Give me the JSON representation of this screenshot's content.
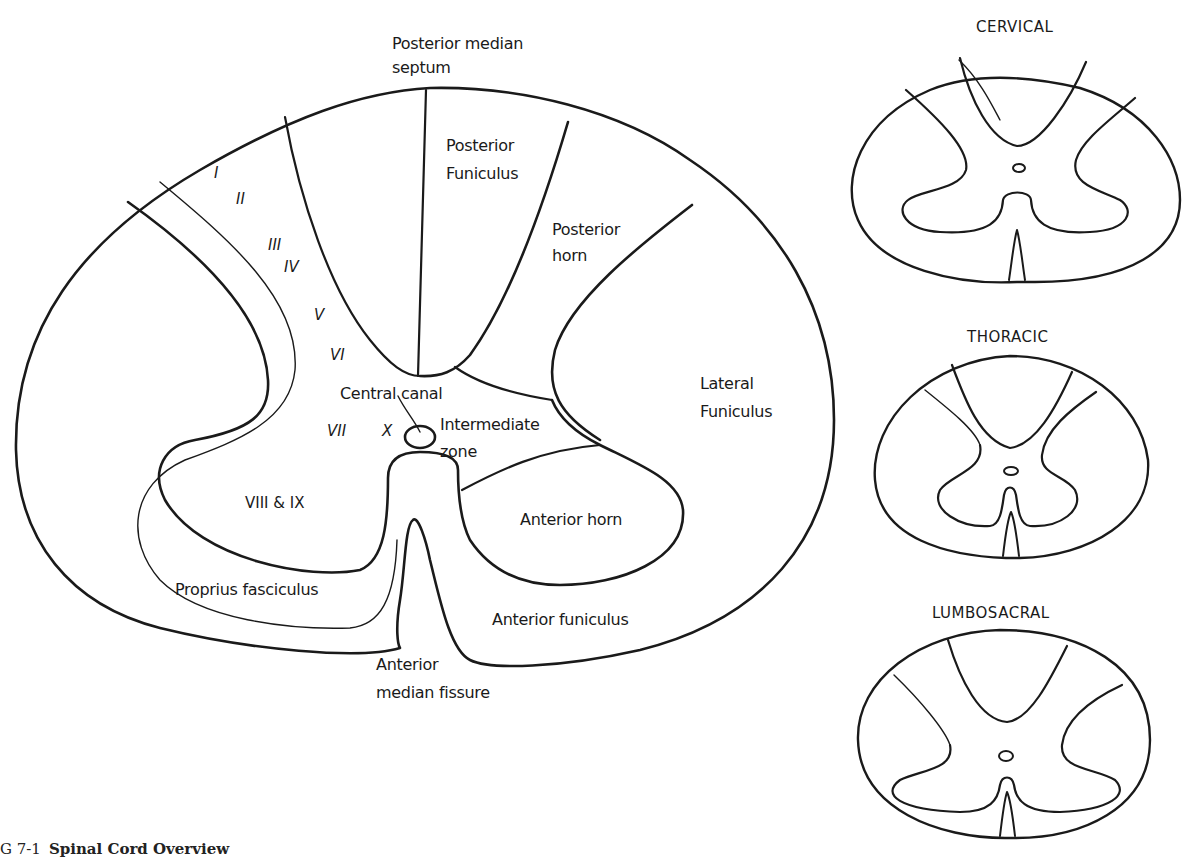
{
  "figure": {
    "caption_prefix": "G 7-1",
    "caption_title": "Spinal Cord Overview"
  },
  "main_diagram": {
    "labels": {
      "posterior_median_septum_1": "Posterior median",
      "posterior_median_septum_2": "septum",
      "posterior_funiculus_1": "Posterior",
      "posterior_funiculus_2": "Funiculus",
      "posterior_horn_1": "Posterior",
      "posterior_horn_2": "horn",
      "lateral_funiculus_1": "Lateral",
      "lateral_funiculus_2": "Funiculus",
      "central_canal": "Central canal",
      "intermediate_zone_1": "Intermediate",
      "intermediate_zone_2": "zone",
      "anterior_horn": "Anterior horn",
      "anterior_funiculus": "Anterior funiculus",
      "anterior_median_fissure_1": "Anterior",
      "anterior_median_fissure_2": "median fissure",
      "proprius_fasciculus": "Proprius fasciculus"
    },
    "laminae": {
      "l1": "I",
      "l2": "II",
      "l3": "III",
      "l4": "IV",
      "l5": "V",
      "l6": "VI",
      "l7": "VII",
      "l8_9": "VIII & IX",
      "l10": "X"
    }
  },
  "regional_sections": [
    {
      "title": "CERVICAL"
    },
    {
      "title": "THORACIC"
    },
    {
      "title": "LUMBOSACRAL"
    }
  ]
}
